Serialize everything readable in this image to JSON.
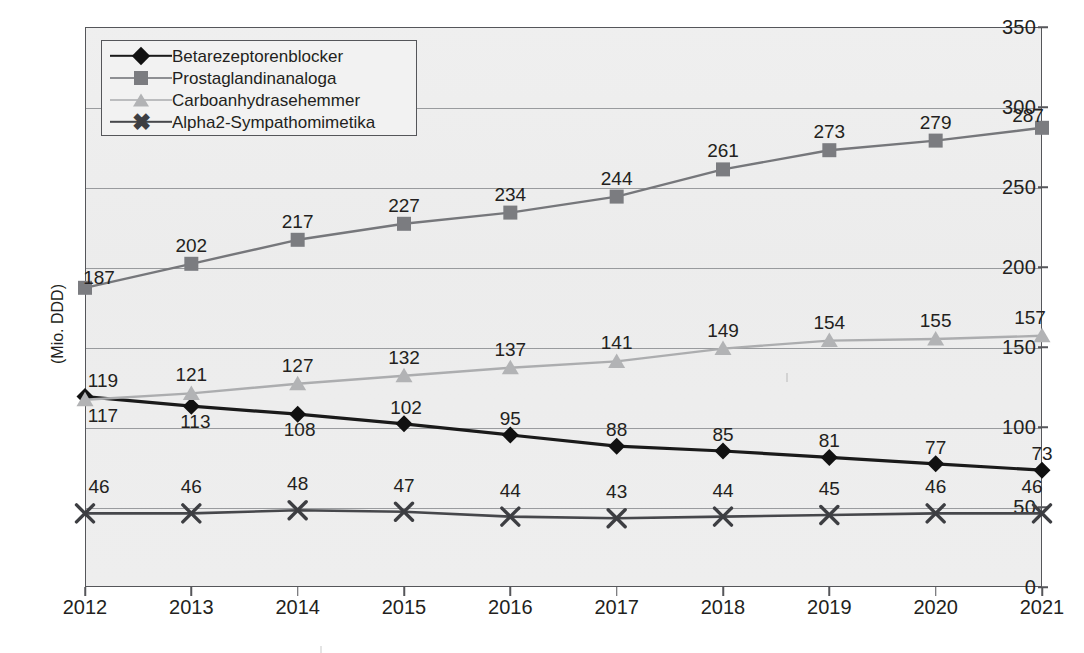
{
  "chart_data": {
    "type": "line",
    "title": "",
    "subtitle": "",
    "xlabel": "",
    "ylabel": "(Mio. DDD)",
    "categories": [
      "2012",
      "2013",
      "2014",
      "2015",
      "2016",
      "2017",
      "2018",
      "2019",
      "2020",
      "2021"
    ],
    "x": [
      2012,
      2013,
      2014,
      2015,
      2016,
      2017,
      2018,
      2019,
      2020,
      2021
    ],
    "ylim": [
      0,
      350
    ],
    "ytick_step": 50,
    "yticks": [
      0,
      50,
      100,
      150,
      200,
      250,
      300,
      350
    ],
    "grid": true,
    "legend_position": "top-left",
    "data_labels": true,
    "series": [
      {
        "name": "Betarezeptorenblocker",
        "marker": "diamond",
        "color": "#111111",
        "line_color": "#1a1a1a",
        "values": [
          119,
          113,
          108,
          102,
          95,
          88,
          85,
          81,
          77,
          73
        ]
      },
      {
        "name": "Prostaglandinanaloga",
        "marker": "square",
        "color": "#7b7c80",
        "line_color": "#76777b",
        "values": [
          187,
          202,
          217,
          227,
          234,
          244,
          261,
          273,
          279,
          287
        ]
      },
      {
        "name": "Carboanhydrasehemmer",
        "marker": "triangle",
        "color": "#b2b3b5",
        "line_color": "#acadaf",
        "values": [
          117,
          121,
          127,
          132,
          137,
          141,
          149,
          154,
          155,
          157
        ]
      },
      {
        "name": "Alpha2-Sympathomimetika",
        "marker": "x",
        "color": "#3d3e42",
        "line_color": "#46474b",
        "values": [
          46,
          46,
          48,
          47,
          44,
          43,
          44,
          45,
          46,
          46
        ]
      }
    ]
  },
  "axis": {
    "y_title": "(Mio. DDD)",
    "y_tick_labels": [
      "350",
      "300",
      "250",
      "200",
      "150",
      "100",
      "50",
      "0"
    ],
    "x_tick_labels": [
      "2012",
      "2013",
      "2014",
      "2015",
      "2016",
      "2017",
      "2018",
      "2019",
      "2020",
      "2021"
    ]
  },
  "legend": {
    "items": [
      {
        "label": "Betarezeptorenblocker",
        "marker": "diamond-marker-icon"
      },
      {
        "label": "Prostaglandinanaloga",
        "marker": "square-marker-icon"
      },
      {
        "label": "Carboanhydrasehemmer",
        "marker": "triangle-marker-icon"
      },
      {
        "label": "Alpha2-Sympathomimetika",
        "marker": "x-marker-icon"
      }
    ]
  },
  "colors": {
    "plot_background": "#eeeeee",
    "frame": "#55565a",
    "gridline": "#8a8c8f",
    "text": "#231f20",
    "series_betarezeptorenblocker": "#111111",
    "series_prostaglandinanaloga": "#7b7c80",
    "series_carboanhydrasehemmer": "#b2b3b5",
    "series_alpha2": "#3d3e42"
  },
  "label_offsets": {
    "Betarezeptorenblocker": [
      [
        18,
        -16
      ],
      [
        4,
        16
      ],
      [
        2,
        16
      ],
      [
        2,
        -16
      ],
      [
        0,
        -16
      ],
      [
        0,
        -16
      ],
      [
        0,
        -16
      ],
      [
        0,
        -16
      ],
      [
        0,
        -16
      ],
      [
        0,
        -16
      ]
    ],
    "Prostaglandinanaloga": [
      [
        14,
        -10
      ],
      [
        0,
        -18
      ],
      [
        0,
        -18
      ],
      [
        0,
        -18
      ],
      [
        0,
        -18
      ],
      [
        0,
        -18
      ],
      [
        0,
        -18
      ],
      [
        0,
        -18
      ],
      [
        0,
        -18
      ],
      [
        -14,
        -12
      ]
    ],
    "Carboanhydrasehemmer": [
      [
        18,
        16
      ],
      [
        0,
        -18
      ],
      [
        0,
        -18
      ],
      [
        0,
        -18
      ],
      [
        0,
        -18
      ],
      [
        0,
        -18
      ],
      [
        0,
        -18
      ],
      [
        0,
        -18
      ],
      [
        0,
        -18
      ],
      [
        -12,
        -18
      ]
    ],
    "Alpha2-Sympathomimetika": [
      [
        14,
        -26
      ],
      [
        0,
        -26
      ],
      [
        0,
        -26
      ],
      [
        0,
        -26
      ],
      [
        0,
        -26
      ],
      [
        0,
        -26
      ],
      [
        0,
        -26
      ],
      [
        0,
        -26
      ],
      [
        0,
        -26
      ],
      [
        -10,
        -26
      ]
    ]
  }
}
